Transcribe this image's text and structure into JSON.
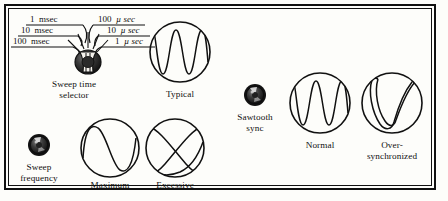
{
  "figure": {
    "background": "#fdfdfa",
    "ink": "#111111"
  },
  "sweep_time_selector": {
    "control_label_line1": "Sweep time",
    "control_label_line2": "selector",
    "icon": "rotary-knob-icon",
    "positions_left": [
      {
        "value": "1",
        "unit": "msec"
      },
      {
        "value": "10",
        "unit": "msec"
      },
      {
        "value": "100",
        "unit": "msec"
      }
    ],
    "positions_right": [
      {
        "value": "100",
        "unit": "µ sec"
      },
      {
        "value": "10",
        "unit": "µ sec"
      },
      {
        "value": "1",
        "unit": "µ sec"
      }
    ]
  },
  "sweep_frequency": {
    "control_label_line1": "Sweep",
    "control_label_line2": "frequency",
    "icon": "rotary-knob-icon"
  },
  "sawtooth_sync": {
    "control_label_line1": "Sawtooth",
    "control_label_line2": "sync",
    "icon": "rotary-knob-icon"
  },
  "waveforms": [
    {
      "id": "typical",
      "caption": "Typical",
      "caption_line2": "",
      "pattern": "sine-2.5-cycles"
    },
    {
      "id": "maximum",
      "caption": "Maximum",
      "caption_line2": "",
      "pattern": "sine-1-cycle"
    },
    {
      "id": "excessive",
      "caption": "Excessive",
      "caption_line2": "",
      "pattern": "crossed-x-lissajous"
    },
    {
      "id": "normal",
      "caption": "Normal",
      "caption_line2": "",
      "pattern": "sine-2.5-cycles"
    },
    {
      "id": "oversync",
      "caption": "Over-",
      "caption_line2": "synchronized",
      "pattern": "folded-v-loop"
    }
  ]
}
